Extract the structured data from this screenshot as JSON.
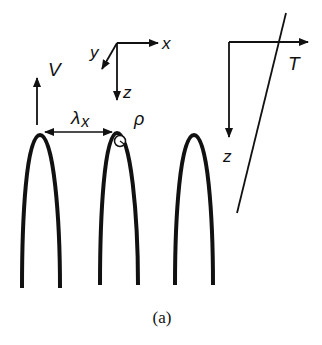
{
  "figure": {
    "caption": "(a)"
  },
  "labels": {
    "velocity": "V",
    "spacing": "λ",
    "spacing_subscript": "x",
    "tip_radius": "ρ",
    "coord_x": "x",
    "coord_y": "y",
    "coord_z": "z",
    "temp_axis": "T",
    "temp_depth": "z"
  },
  "colors": {
    "stroke": "#111111",
    "background": "#ffffff"
  },
  "elements": {
    "dendrites": [
      {
        "id": 1,
        "tip_x": 40,
        "tip_y": 135
      },
      {
        "id": 2,
        "tip_x": 117,
        "tip_y": 133
      },
      {
        "id": 3,
        "tip_x": 194,
        "tip_y": 135
      }
    ]
  }
}
